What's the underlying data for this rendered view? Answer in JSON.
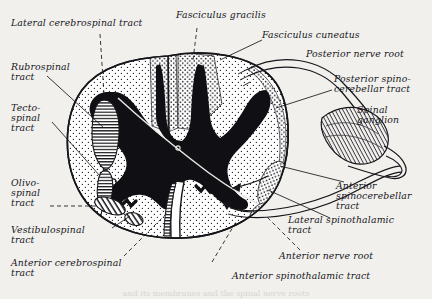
{
  "figure": {
    "background_color": "#f1f0ed",
    "ink_color": "#16161a",
    "gray_matter_color": "#101014",
    "white_matter_color": "#ffffff",
    "caption_fragment": "and its membranes and the spinal nerve roots"
  },
  "labels": {
    "lateral_cerebrospinal_tract": "Lateral cerebrospinal tract",
    "rubrospinal_tract": "Rubrospinal\ntract",
    "tectospinal_tract": "Tecto-\nspinal\ntract",
    "olivospinal_tract": "Olivo-\nspinal\ntract",
    "vestibulospinal_tract": "Vestibulospinal\ntract",
    "anterior_cerebrospinal_tract": "Anterior cerebrospinal\ntract",
    "fasciculus_gracilis": "Fasciculus gracilis",
    "fasciculus_cuneatus": "Fasciculus cuneatus",
    "posterior_nerve_root": "Posterior nerve root",
    "posterior_spinocerebellar_tract": "Posterior spino-\ncerebellar tract",
    "spinal_ganglion": "Spinal\nganglion",
    "anterior_spinocerebellar_tract": "Anterior\nspinocerebellar\ntract",
    "lateral_spinothalamic_tract": "Lateral spinothalamic\ntract",
    "anterior_nerve_root": "Anterior nerve root",
    "anterior_spinothalamic_tract": "Anterior spinothalamic tract"
  },
  "structures": {
    "cord_outline": "spinal-cord-circumference",
    "gray_matter": "butterfly-shaped-gray-matter",
    "central_canal": "central-canal",
    "posterior_median_septum": "posterior-median-septum",
    "anterior_median_fissure": "anterior-median-fissure",
    "dorsal_root": "posterior-nerve-root-filaments",
    "ventral_root": "anterior-nerve-root-filaments",
    "ganglion": "spinal-ganglion-swelling",
    "mixed_nerve": "mixed-spinal-nerve"
  }
}
